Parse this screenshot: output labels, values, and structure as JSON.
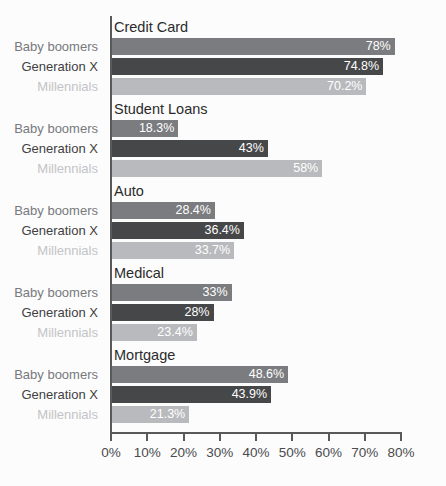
{
  "chart_data": {
    "type": "bar",
    "orientation": "horizontal",
    "title": "",
    "subtitle": "",
    "xlabel": "",
    "ylabel": "",
    "xlim": [
      0,
      80
    ],
    "grid": false,
    "legend_position": "none",
    "tick_labels": [
      "0%",
      "10%",
      "20%",
      "30%",
      "40%",
      "50%",
      "60%",
      "70%",
      "80%"
    ],
    "tick_values": [
      0,
      10,
      20,
      30,
      40,
      50,
      60,
      70,
      80
    ],
    "categories": [
      "Credit Card",
      "Student Loans",
      "Auto",
      "Medical",
      "Mortgage"
    ],
    "series": [
      {
        "name": "Baby boomers",
        "color": "#7b7c80",
        "label_color": "#78797d",
        "values": [
          78,
          18.3,
          28.4,
          33,
          48.6
        ],
        "value_labels": [
          "78%",
          "18.3%",
          "28.4%",
          "33%",
          "48.6%"
        ]
      },
      {
        "name": "Generation X",
        "color": "#464749",
        "label_color": "#3f4042",
        "values": [
          74.8,
          43,
          36.4,
          28,
          43.9
        ],
        "value_labels": [
          "74.8%",
          "43%",
          "36.4%",
          "28%",
          "43.9%"
        ]
      },
      {
        "name": "Millennials",
        "color": "#b9babd",
        "label_color": "#c3c4c7",
        "values": [
          70.2,
          58,
          33.7,
          23.4,
          21.3
        ],
        "value_labels": [
          "70.2%",
          "58%",
          "33.7%",
          "23.4%",
          "21.3%"
        ]
      }
    ]
  },
  "groups": [
    {
      "title": "Credit Card",
      "rows": [
        {
          "label": "Baby boomers",
          "value_label": "78%",
          "value": 78
        },
        {
          "label": "Generation X",
          "value_label": "74.8%",
          "value": 74.8
        },
        {
          "label": "Millennials",
          "value_label": "70.2%",
          "value": 70.2
        }
      ]
    },
    {
      "title": "Student Loans",
      "rows": [
        {
          "label": "Baby boomers",
          "value_label": "18.3%",
          "value": 18.3
        },
        {
          "label": "Generation X",
          "value_label": "43%",
          "value": 43
        },
        {
          "label": "Millennials",
          "value_label": "58%",
          "value": 58
        }
      ]
    },
    {
      "title": "Auto",
      "rows": [
        {
          "label": "Baby boomers",
          "value_label": "28.4%",
          "value": 28.4
        },
        {
          "label": "Generation X",
          "value_label": "36.4%",
          "value": 36.4
        },
        {
          "label": "Millennials",
          "value_label": "33.7%",
          "value": 33.7
        }
      ]
    },
    {
      "title": "Medical",
      "rows": [
        {
          "label": "Baby boomers",
          "value_label": "33%",
          "value": 33
        },
        {
          "label": "Generation X",
          "value_label": "28%",
          "value": 28
        },
        {
          "label": "Millennials",
          "value_label": "23.4%",
          "value": 23.4
        }
      ]
    },
    {
      "title": "Mortgage",
      "rows": [
        {
          "label": "Baby boomers",
          "value_label": "48.6%",
          "value": 48.6
        },
        {
          "label": "Generation X",
          "value_label": "43.9%",
          "value": 43.9
        },
        {
          "label": "Millennials",
          "value_label": "21.3%",
          "value": 21.3
        }
      ]
    }
  ],
  "axis": {
    "ticks": [
      "0%",
      "10%",
      "20%",
      "30%",
      "40%",
      "50%",
      "60%",
      "70%",
      "80%"
    ]
  }
}
